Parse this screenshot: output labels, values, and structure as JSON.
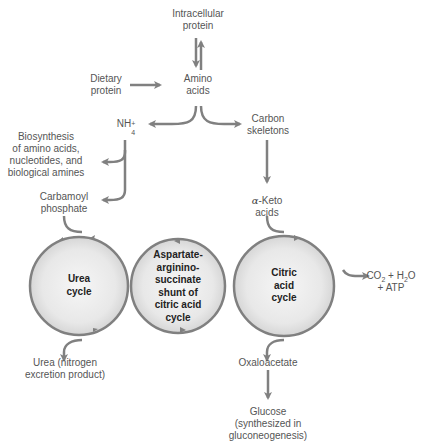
{
  "diagram": {
    "type": "amino acid catabolism pathway",
    "colors": {
      "arrow": "#808080",
      "circle_stroke": "#808080",
      "circle_fill_center": "#f4f4f4",
      "circle_fill_edge": "#dcdcdc",
      "label_text": "#555555",
      "cycle_text": "#222222"
    },
    "nodes": {
      "intracellular_protein": {
        "line1": "Intracellular",
        "line2": "protein"
      },
      "amino_acids": {
        "line1": "Amino",
        "line2": "acids"
      },
      "dietary_protein": {
        "line1": "Dietary",
        "line2": "protein"
      },
      "nh4": {
        "base": "NH",
        "sub": "4",
        "sup": "+"
      },
      "carbon_skeletons": {
        "line1": "Carbon",
        "line2": "skeletons"
      },
      "biosynthesis": {
        "line1": "Biosynthesis",
        "line2": "of amino acids,",
        "line3": "nucleotides, and",
        "line4": "biological amines"
      },
      "carbamoyl_phosphate": {
        "line1": "Carbamoyl",
        "line2": "phosphate"
      },
      "alpha_keto_acids": {
        "greek": "α",
        "line1": "-Keto",
        "line2": "acids"
      },
      "co2_h2o_atp": {
        "co": "CO",
        "co_sub": "2",
        "plus1": " + H",
        "h_sub": "2",
        "o": "O",
        "line2": "+ ATP"
      },
      "urea": {
        "line1": "Urea (nitrogen",
        "line2": "excretion product)"
      },
      "oxaloacetate": {
        "line1": "Oxaloacetate"
      },
      "glucose": {
        "line1": "Glucose",
        "line2": "(synthesized in",
        "line3": "gluconeogenesis)"
      }
    },
    "cycles": {
      "urea_cycle": {
        "line1": "Urea",
        "line2": "cycle"
      },
      "shunt": {
        "line1": "Aspartate-",
        "line2": "argininо-",
        "line3": "succinate",
        "line4": "shunt of",
        "line5": "citric acid",
        "line6": "cycle"
      },
      "citric_acid_cycle": {
        "line1": "Citric",
        "line2": "acid",
        "line3": "cycle"
      }
    },
    "edges": [
      {
        "from": "intracellular_protein",
        "to": "amino_acids",
        "kind": "reversible"
      },
      {
        "from": "dietary_protein",
        "to": "amino_acids"
      },
      {
        "from": "amino_acids",
        "to": "nh4"
      },
      {
        "from": "amino_acids",
        "to": "carbon_skeletons"
      },
      {
        "from": "nh4",
        "to": "biosynthesis"
      },
      {
        "from": "nh4",
        "to": "carbamoyl_phosphate"
      },
      {
        "from": "carbon_skeletons",
        "to": "alpha_keto_acids"
      },
      {
        "from": "carbamoyl_phosphate",
        "to": "urea_cycle"
      },
      {
        "from": "alpha_keto_acids",
        "to": "citric_acid_cycle"
      },
      {
        "from": "citric_acid_cycle",
        "to": "co2_h2o_atp"
      },
      {
        "from": "urea_cycle",
        "to": "urea"
      },
      {
        "from": "citric_acid_cycle",
        "to": "oxaloacetate"
      },
      {
        "from": "oxaloacetate",
        "to": "glucose"
      }
    ]
  }
}
